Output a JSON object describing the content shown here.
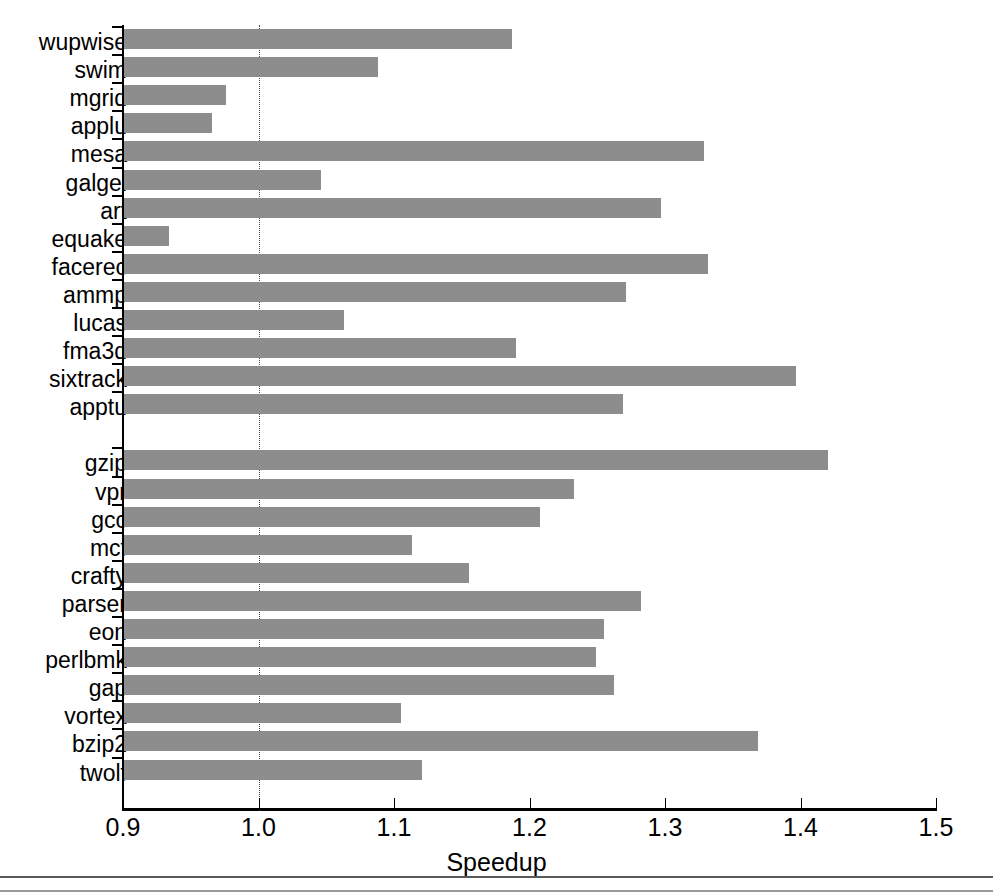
{
  "chart_data": {
    "type": "bar",
    "orientation": "horizontal",
    "title": "",
    "xlabel": "Speedup",
    "ylabel": "",
    "xlim": [
      0.9,
      1.5
    ],
    "xticks": [
      0.9,
      1.0,
      1.1,
      1.2,
      1.3,
      1.4,
      1.5
    ],
    "xtick_labels": [
      "0.9",
      "1.0",
      "1.1",
      "1.2",
      "1.3",
      "1.4",
      "1.5"
    ],
    "grid": false,
    "legend": "none",
    "reference_line": 1.0,
    "reference_line_style": "dotted",
    "bar_color": "#8d8d8d",
    "groups": [
      {
        "name": "SPEC CFP2000",
        "categories": [
          "wupwise",
          "swim",
          "mgrid",
          "applu",
          "mesa",
          "galgel",
          "art",
          "equake",
          "facerec",
          "ammp",
          "lucas",
          "fma3d",
          "sixtrack",
          "apptu"
        ],
        "values": [
          1.187,
          1.088,
          0.976,
          0.966,
          1.329,
          1.046,
          1.297,
          0.934,
          1.332,
          1.271,
          1.063,
          1.19,
          1.397,
          1.269
        ]
      },
      {
        "name": "SPEC CINT2000",
        "categories": [
          "gzip",
          "vpr",
          "gcc",
          "mcf",
          "crafty",
          "parser",
          "eon",
          "perlbmk",
          "gap",
          "vortex",
          "bzip2",
          "twolf"
        ],
        "values": [
          1.42,
          1.233,
          1.208,
          1.113,
          1.155,
          1.282,
          1.255,
          1.249,
          1.262,
          1.105,
          1.369,
          1.121
        ]
      }
    ]
  }
}
